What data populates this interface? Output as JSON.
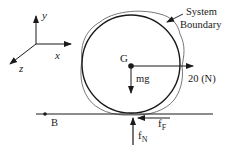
{
  "diagram": {
    "type": "free-body-diagram",
    "axes": {
      "x_label": "x",
      "y_label": "y",
      "z_label": "z"
    },
    "system_boundary_label_line1": "System",
    "system_boundary_label_line2": "Boundary",
    "center_label": "G",
    "weight_label": "mg",
    "applied_force_label": "20 (N)",
    "point_label": "B",
    "friction_label_main": "f",
    "friction_label_sub": "F",
    "normal_label_main": "f",
    "normal_label_sub": "N",
    "colors": {
      "ink": "#1a1a1a",
      "boundary": "#555555",
      "background": "#ffffff"
    }
  }
}
